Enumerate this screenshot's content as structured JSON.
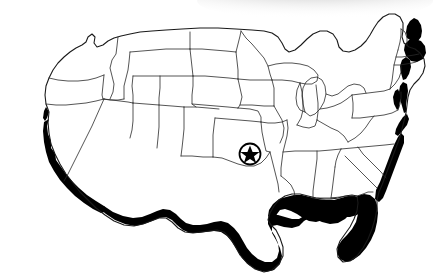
{
  "figure": {
    "kind": "choropleth-outline-map",
    "background_color": "#ffffff",
    "outline_color": "#1a1a1a",
    "shaded_color": "#000000",
    "outline_width_px": 0.9,
    "width_px": 434,
    "height_px": 278,
    "title": "",
    "caption": "",
    "legend": [],
    "labels": []
  },
  "artifacts": {
    "scan_shadow": {
      "name": "scan-shadow",
      "description": "soft gray smudge along upper-right edge",
      "color": "#b9b9b9",
      "x": 200,
      "y": 0,
      "width": 234,
      "height": 22,
      "opacity": 0.55
    }
  },
  "markers": [
    {
      "name": "star-location-marker",
      "shape": "star-in-circle",
      "cx": 250,
      "cy": 154,
      "radius": 11,
      "fill": "#000000",
      "label": ""
    }
  ],
  "shaded_regions": [
    {
      "name": "pacific-coast-california",
      "label": "Pacific Coast"
    },
    {
      "name": "southwest-border",
      "label": "Southwest Border"
    },
    {
      "name": "gulf-coast",
      "label": "Gulf Coast"
    },
    {
      "name": "south-atlantic-coast",
      "label": "South Atlantic Coast"
    },
    {
      "name": "mid-atlantic-coast",
      "label": "Mid-Atlantic Coast"
    },
    {
      "name": "new-england-coast",
      "label": "New England Coast"
    }
  ],
  "geometry": {
    "national_outline": "M 47,118 L 44,104 L 45,92 L 50,79 L 57,68 L 64,58 L 72,50 L 80,45 L 86,42 L 90,46 L 93,52 L 97,50 L 100,44 L 105,41 L 112,40 L 120,36 L 130,33 L 140,31 L 155,29 L 175,27 L 200,26 L 225,26 L 250,27 L 268,28 L 280,29 L 286,33 L 290,40 L 293,47 L 297,50 L 303,48 L 310,42 L 318,36 L 326,32 L 334,31 L 340,34 L 344,39 L 346,45 L 349,50 L 355,52 L 362,50 L 368,45 L 374,40 L 378,34 L 382,28 L 386,22 L 390,17 L 395,13 L 400,12 L 404,15 L 406,21 L 405,28 L 403,35 L 404,42 L 408,47 L 414,50 L 419,54 L 422,60 L 423,68 L 421,76 L 417,84 L 412,92 L 408,100 L 405,108 L 403,116 L 400,124 L 396,132 L 392,140 L 388,148 L 383,156 L 378,164 L 373,172 L 368,180 L 362,188 L 356,195 L 350,201 L 344,206 L 338,212 L 332,219 L 327,227 L 322,236 L 317,244 L 311,250 L 305,252 L 300,248 L 296,241 L 293,233 L 289,226 L 284,222 L 277,221 L 270,223 L 262,226 L 254,229 L 246,233 L 238,239 L 231,246 L 225,254 L 219,262 L 213,268 L 206,270 L 200,267 L 196,260 L 194,252 L 192,244 L 189,237 L 184,232 L 178,229 L 171,228 L 164,228 L 157,227 L 150,224 L 144,220 L 138,215 L 132,211 L 125,208 L 118,206 L 111,203 L 104,199 L 97,194 L 91,188 L 85,181 L 79,173 L 73,165 L 68,157 L 63,149 L 58,141 L 53,132 L 49,125 Z",
    "pacific_coast_band": "M 47,118 L 44,104 L 45,92 L 50,79 L 57,68 L 64,58 L 56,76 L 52,90 L 51,104 L 54,117 L 60,129 L 68,141 L 78,152 L 90,162 L 103,170 L 117,177 L 131,183 L 128,190 L 114,185 L 100,178 L 87,170 L 74,160 L 63,148 L 54,134 Z",
    "star_points": "250,143 253,150 261,150 255,155 257,163 250,158 243,163 245,155 239,150 247,150"
  },
  "states": [
    {
      "code": "WA",
      "name": "Washington",
      "shaded": false
    },
    {
      "code": "OR",
      "name": "Oregon",
      "shaded": false
    },
    {
      "code": "CA",
      "name": "California",
      "shaded": true
    },
    {
      "code": "ID",
      "name": "Idaho",
      "shaded": false
    },
    {
      "code": "NV",
      "name": "Nevada",
      "shaded": false
    },
    {
      "code": "MT",
      "name": "Montana",
      "shaded": false
    },
    {
      "code": "WY",
      "name": "Wyoming",
      "shaded": false
    },
    {
      "code": "UT",
      "name": "Utah",
      "shaded": false
    },
    {
      "code": "AZ",
      "name": "Arizona",
      "shaded": true
    },
    {
      "code": "CO",
      "name": "Colorado",
      "shaded": false
    },
    {
      "code": "NM",
      "name": "New Mexico",
      "shaded": true
    },
    {
      "code": "ND",
      "name": "North Dakota",
      "shaded": false
    },
    {
      "code": "SD",
      "name": "South Dakota",
      "shaded": false
    },
    {
      "code": "NE",
      "name": "Nebraska",
      "shaded": false
    },
    {
      "code": "KS",
      "name": "Kansas",
      "shaded": false
    },
    {
      "code": "OK",
      "name": "Oklahoma",
      "shaded": false
    },
    {
      "code": "TX",
      "name": "Texas",
      "shaded": true
    },
    {
      "code": "MN",
      "name": "Minnesota",
      "shaded": false
    },
    {
      "code": "IA",
      "name": "Iowa",
      "shaded": false
    },
    {
      "code": "MO",
      "name": "Missouri",
      "shaded": false
    },
    {
      "code": "AR",
      "name": "Arkansas",
      "shaded": false
    },
    {
      "code": "LA",
      "name": "Louisiana",
      "shaded": true
    },
    {
      "code": "WI",
      "name": "Wisconsin",
      "shaded": false
    },
    {
      "code": "IL",
      "name": "Illinois",
      "shaded": false
    },
    {
      "code": "MI",
      "name": "Michigan",
      "shaded": false
    },
    {
      "code": "IN",
      "name": "Indiana",
      "shaded": false
    },
    {
      "code": "OH",
      "name": "Ohio",
      "shaded": false
    },
    {
      "code": "KY",
      "name": "Kentucky",
      "shaded": false
    },
    {
      "code": "TN",
      "name": "Tennessee",
      "shaded": false
    },
    {
      "code": "MS",
      "name": "Mississippi",
      "shaded": true
    },
    {
      "code": "AL",
      "name": "Alabama",
      "shaded": true
    },
    {
      "code": "GA",
      "name": "Georgia",
      "shaded": true
    },
    {
      "code": "FL",
      "name": "Florida",
      "shaded": true
    },
    {
      "code": "SC",
      "name": "South Carolina",
      "shaded": true
    },
    {
      "code": "NC",
      "name": "North Carolina",
      "shaded": true
    },
    {
      "code": "VA",
      "name": "Virginia",
      "shaded": true
    },
    {
      "code": "WV",
      "name": "West Virginia",
      "shaded": false
    },
    {
      "code": "MD",
      "name": "Maryland",
      "shaded": true
    },
    {
      "code": "DE",
      "name": "Delaware",
      "shaded": true
    },
    {
      "code": "PA",
      "name": "Pennsylvania",
      "shaded": false
    },
    {
      "code": "NJ",
      "name": "New Jersey",
      "shaded": true
    },
    {
      "code": "NY",
      "name": "New York",
      "shaded": true
    },
    {
      "code": "CT",
      "name": "Connecticut",
      "shaded": true
    },
    {
      "code": "RI",
      "name": "Rhode Island",
      "shaded": true
    },
    {
      "code": "MA",
      "name": "Massachusetts",
      "shaded": true
    },
    {
      "code": "VT",
      "name": "Vermont",
      "shaded": false
    },
    {
      "code": "NH",
      "name": "New Hampshire",
      "shaded": false
    },
    {
      "code": "ME",
      "name": "Maine",
      "shaded": true
    }
  ]
}
